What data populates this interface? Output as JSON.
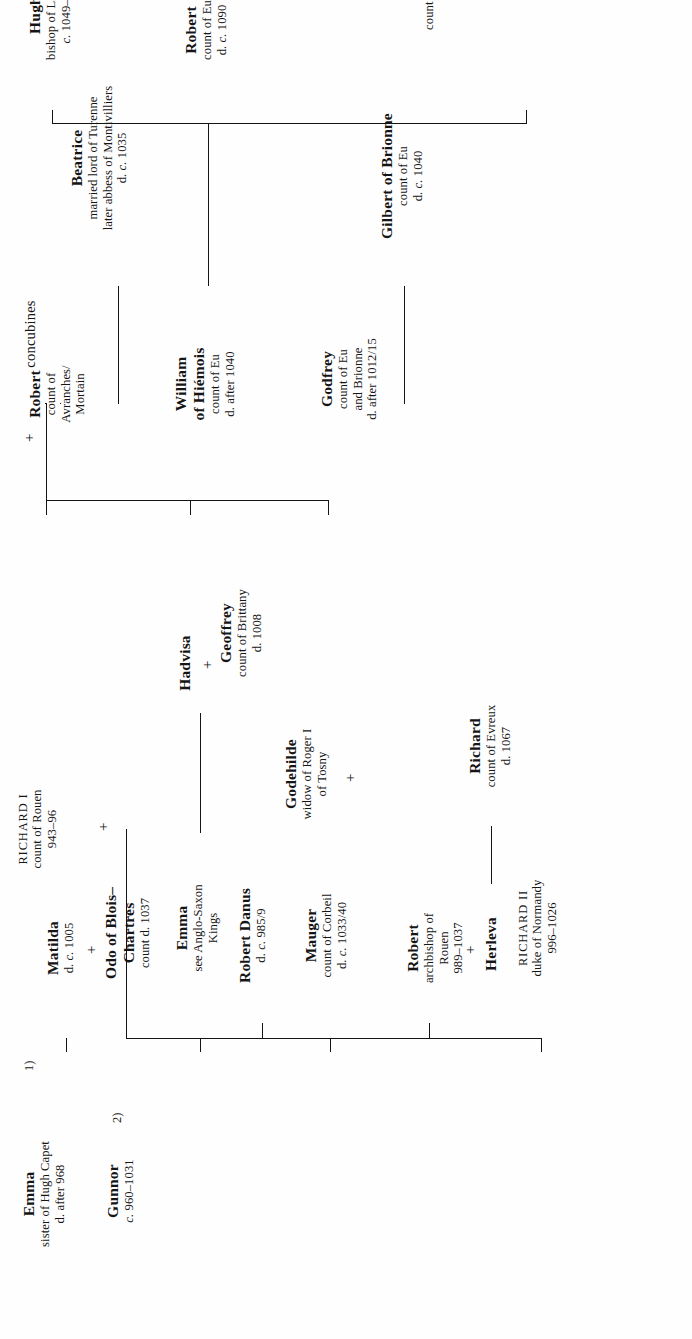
{
  "chart_title": "Genealogical table of the Norman ducal house",
  "unions": {
    "marker": "+",
    "order_1": "1)",
    "order_2": "2)"
  },
  "nodes": {
    "richard1": {
      "name": "RICHARD I",
      "lines": [
        "count of Rouen",
        "943–96"
      ],
      "style": "caps"
    },
    "emma_capet": {
      "name": "Emma",
      "lines": [
        "sister of Hugh Capet",
        "d. after 968"
      ]
    },
    "gunnor": {
      "name": "Gunnor",
      "lines": [
        "c. 960–1031"
      ]
    },
    "concubines": {
      "name": "concubines",
      "lines": []
    },
    "richard2": {
      "name": "RICHARD II",
      "lines": [
        "duke of Normandy",
        "996–1026"
      ],
      "style": "caps"
    },
    "robert_abp": {
      "name": "Robert",
      "lines": [
        "archbishop of",
        "Rouen",
        "989–1037"
      ]
    },
    "herleva": {
      "name": "Herleva",
      "lines": []
    },
    "richard_ev": {
      "name": "Richard",
      "lines": [
        "count of Evreux",
        "d. 1067"
      ]
    },
    "mauger": {
      "name": "Mauger",
      "lines": [
        "count of Corbeil",
        "d. c. 1033/40"
      ]
    },
    "robert_dan": {
      "name": "Robert Danus",
      "lines": [
        "d. c. 985/9"
      ]
    },
    "godehilde": {
      "name": "Godehilde",
      "lines": [
        "widow of Roger I",
        "of Tosny"
      ]
    },
    "emma_as": {
      "name": "Emma",
      "lines": [
        "see Anglo-Saxon",
        "Kings"
      ]
    },
    "hadvisa": {
      "name": "Hadvisa",
      "lines": []
    },
    "geoffrey": {
      "name": "Geoffrey",
      "lines": [
        "count of Brittany",
        "d. 1008"
      ]
    },
    "matilda": {
      "name": "Matilda",
      "lines": [
        "d. c. 1005"
      ]
    },
    "odo": {
      "name": "Odo of Blois–",
      "lines": [
        "Chartres",
        "count d. 1037"
      ]
    },
    "godfrey": {
      "name": "Godfrey",
      "lines": [
        "count of Eu",
        "and Brionne",
        "d. after 1012/15"
      ]
    },
    "gilbert": {
      "name": "Gilbert of Brionne",
      "lines": [
        "count of Eu",
        "d. c. 1040"
      ]
    },
    "william_h": {
      "name": "William",
      "lines": [
        "of Hiémois",
        "count of Eu",
        "d. after 1040"
      ]
    },
    "beatrice": {
      "name": "Beatrice",
      "lines": [
        "married lord of Turenne",
        "later abbess of Montivilliers",
        "d. c. 1035"
      ]
    },
    "robert_avr": {
      "name": "Robert",
      "lines": [
        "count of",
        "Avranches/",
        "Mortain"
      ]
    },
    "william_busac": {
      "name": "William Busac",
      "lines": [
        "count of Eu dispossessed c. 1050",
        "count of Soissons",
        "c. 1057–c. 1076"
      ]
    },
    "robert_eu": {
      "name": "Robert",
      "lines": [
        "count of Eu",
        "d. c. 1090"
      ]
    },
    "hugh": {
      "name": "Hugh",
      "lines": [
        "bishop of Lisieux",
        "c. 1049–77"
      ]
    }
  }
}
